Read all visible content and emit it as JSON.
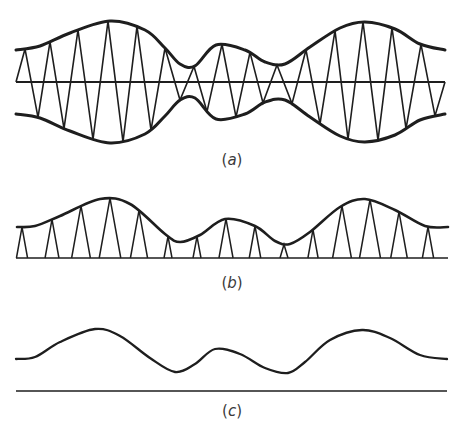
{
  "figure": {
    "panels": [
      {
        "id": "a",
        "label": "(a)",
        "description": "Amplitude-modulated carrier with upper and lower envelopes and a zero axis",
        "axis_y": 82,
        "axis_x": [
          16,
          445
        ],
        "upper_envelope": [
          [
            16,
            50
          ],
          [
            40,
            46
          ],
          [
            70,
            33
          ],
          [
            110,
            21
          ],
          [
            145,
            30
          ],
          [
            165,
            48
          ],
          [
            180,
            64
          ],
          [
            195,
            66
          ],
          [
            216,
            45
          ],
          [
            245,
            50
          ],
          [
            265,
            62
          ],
          [
            285,
            64
          ],
          [
            310,
            47
          ],
          [
            340,
            28
          ],
          [
            365,
            22
          ],
          [
            395,
            29
          ],
          [
            420,
            44
          ],
          [
            445,
            50
          ]
        ],
        "zigzag_x": [
          25,
          38,
          50,
          64,
          78,
          93,
          108,
          123,
          137,
          151,
          165,
          180,
          194,
          207,
          222,
          236,
          250,
          263,
          277,
          292,
          306,
          320,
          335,
          348,
          363,
          378,
          392,
          406,
          421,
          435
        ]
      },
      {
        "id": "b",
        "label": "(b)",
        "description": "Rectified (half-wave) samples under the envelope",
        "baseline_y": 258,
        "baseline_x": [
          16,
          448
        ],
        "envelope": [
          [
            17,
            227
          ],
          [
            35,
            226
          ],
          [
            60,
            216
          ],
          [
            100,
            199
          ],
          [
            130,
            204
          ],
          [
            165,
            234
          ],
          [
            180,
            242
          ],
          [
            200,
            235
          ],
          [
            225,
            219
          ],
          [
            255,
            226
          ],
          [
            275,
            241
          ],
          [
            290,
            244
          ],
          [
            310,
            232
          ],
          [
            340,
            207
          ],
          [
            365,
            199
          ],
          [
            395,
            210
          ],
          [
            425,
            226
          ],
          [
            448,
            227
          ]
        ],
        "spike_x": [
          22,
          52,
          81,
          110,
          139,
          168,
          197,
          226,
          255,
          284,
          313,
          342,
          370,
          399,
          428
        ]
      },
      {
        "id": "c",
        "label": "(c)",
        "description": "Recovered envelope after filtering",
        "baseline_y": 391,
        "baseline_x": [
          16,
          447
        ],
        "curve": [
          [
            16,
            359
          ],
          [
            35,
            357
          ],
          [
            60,
            342
          ],
          [
            95,
            329
          ],
          [
            120,
            336
          ],
          [
            150,
            358
          ],
          [
            175,
            372
          ],
          [
            195,
            364
          ],
          [
            215,
            349
          ],
          [
            240,
            354
          ],
          [
            265,
            368
          ],
          [
            288,
            373
          ],
          [
            305,
            362
          ],
          [
            330,
            340
          ],
          [
            362,
            330
          ],
          [
            390,
            338
          ],
          [
            420,
            355
          ],
          [
            447,
            359
          ]
        ]
      }
    ]
  },
  "labels": {
    "a": {
      "open": "(",
      "letter": "a",
      "close": ")"
    },
    "b": {
      "open": "(",
      "letter": "b",
      "close": ")"
    },
    "c": {
      "open": "(",
      "letter": "c",
      "close": ")"
    }
  },
  "colors": {
    "ink": "#1e1e1e",
    "label": "#3a3a3a",
    "background": "#ffffff"
  }
}
